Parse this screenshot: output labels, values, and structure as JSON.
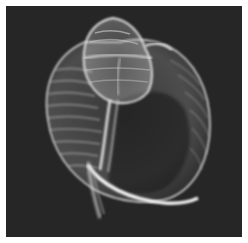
{
  "image": {
    "subject": "X-ray of a spiral sea shell",
    "background_color": "#262626",
    "frame_color": "#ffffff",
    "shell_color": "#e8e8e8"
  }
}
